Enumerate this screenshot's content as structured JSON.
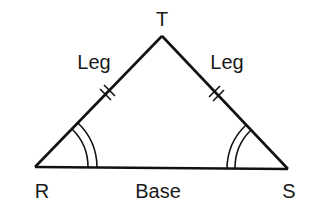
{
  "diagram": {
    "type": "isosceles-triangle",
    "vertices": {
      "top": {
        "label": "T"
      },
      "left": {
        "label": "R"
      },
      "right": {
        "label": "S"
      }
    },
    "sides": {
      "left_leg": {
        "label": "Leg",
        "tick_marks": 2
      },
      "right_leg": {
        "label": "Leg",
        "tick_marks": 2
      },
      "base": {
        "label": "Base"
      }
    },
    "angle_marks": {
      "left": {
        "arcs": 2
      },
      "right": {
        "arcs": 2
      }
    },
    "colors": {
      "stroke": "#111111",
      "background": "#ffffff"
    }
  }
}
